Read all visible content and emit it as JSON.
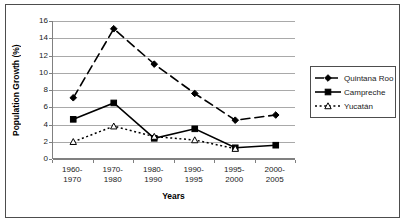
{
  "chart_data": {
    "type": "line",
    "title": "",
    "xlabel": "Years",
    "ylabel": "Population Growth (%)",
    "categories": [
      "1960-1970",
      "1970-1980",
      "1980-1990",
      "1990-1995",
      "1995-2000",
      "2000-2005"
    ],
    "category_lines": [
      [
        "1960-",
        "1970"
      ],
      [
        "1970-",
        "1980"
      ],
      [
        "1980-",
        "1990"
      ],
      [
        "1990-",
        "1995"
      ],
      [
        "1995-",
        "2000"
      ],
      [
        "2000-",
        "2005"
      ]
    ],
    "ylim": [
      0,
      16
    ],
    "yticks": [
      0,
      2,
      4,
      6,
      8,
      10,
      12,
      14,
      16
    ],
    "grid": true,
    "legend_position": "right-outside",
    "series": [
      {
        "name": "Quintana Roo",
        "marker": "diamond",
        "line_style": "dashed",
        "color": "#000000",
        "values": [
          7.1,
          15.1,
          11.0,
          7.6,
          4.5,
          5.1
        ]
      },
      {
        "name": "Campreche",
        "marker": "square",
        "line_style": "solid",
        "color": "#000000",
        "values": [
          4.6,
          6.5,
          2.4,
          3.5,
          1.3,
          1.6
        ]
      },
      {
        "name": "Yucatán",
        "marker": "triangle",
        "line_style": "dotted",
        "color": "#000000",
        "values": [
          2.0,
          3.8,
          2.6,
          2.2,
          1.2,
          null
        ]
      }
    ]
  },
  "legend": {
    "items": [
      {
        "label": "Quintana Roo"
      },
      {
        "label": "Campreche"
      },
      {
        "label": "Yucatán"
      }
    ]
  },
  "axes": {
    "y_title": "Population Growth (%)",
    "x_title": "Years"
  }
}
